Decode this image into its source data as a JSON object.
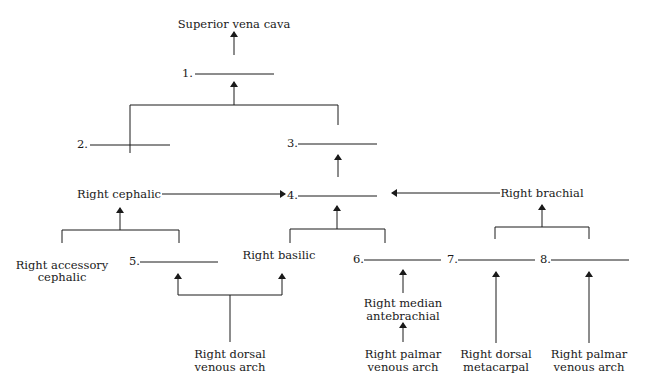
{
  "diagram": {
    "labels": {
      "svc": "Superior vena cava",
      "right_cephalic": "Right cephalic",
      "right_brachial": "Right brachial",
      "right_accessory_cephalic_1": "Right accessory",
      "right_accessory_cephalic_2": "cephalic",
      "right_basilic": "Right basilic",
      "right_median_antebrachial_1": "Right median",
      "right_median_antebrachial_2": "antebrachial",
      "right_dorsal_venous_arch_1": "Right dorsal",
      "right_dorsal_venous_arch_2": "venous arch",
      "right_palmar_venous_arch_a_1": "Right palmar",
      "right_palmar_venous_arch_a_2": "venous arch",
      "right_dorsal_metacarpal_1": "Right dorsal",
      "right_dorsal_metacarpal_2": "metacarpal",
      "right_palmar_venous_arch_b_1": "Right palmar",
      "right_palmar_venous_arch_b_2": "venous arch"
    },
    "blanks": [
      "1.",
      "2.",
      "3.",
      "4.",
      "5.",
      "6.",
      "7.",
      "8."
    ],
    "line_color": "#1a1a1a"
  }
}
